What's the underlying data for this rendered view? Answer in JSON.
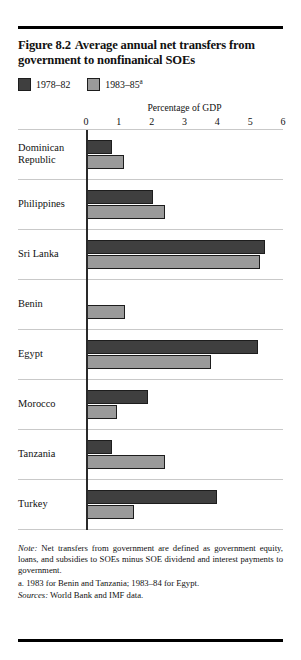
{
  "figure": {
    "number": "Figure 8.2",
    "title": "Average annual net transfers from government to nonfinanical SOEs"
  },
  "legend": {
    "items": [
      {
        "label": "1978–82",
        "superscript": "",
        "color": "#3f3f3f"
      },
      {
        "label": "1983–85",
        "superscript": "a",
        "color": "#9a9a9a"
      }
    ]
  },
  "notes": {
    "note_lead": "Note:",
    "note_text": " Net transfers from government are defined as government equity, loans, and subsidies to SOEs minus SOE dividend and interest payments to government.",
    "note_a": "a. 1983 for Benin and Tanzania; 1983–84 for Egypt.",
    "sources_lead": "Sources:",
    "sources_text": " World Bank and IMF data."
  },
  "chart_data": {
    "type": "bar",
    "orientation": "horizontal",
    "xlabel": "Percentage of GDP",
    "ylabel": "",
    "xlim": [
      0,
      6
    ],
    "xticks": [
      0,
      1,
      2,
      3,
      4,
      5,
      6
    ],
    "xticklabels": [
      "0",
      "1",
      "2",
      "3",
      "4",
      "5",
      "6"
    ],
    "grid": false,
    "legend_position": "top-left",
    "categories": [
      "Dominican Republic",
      "Philippines",
      "Sri Lanka",
      "Benin",
      "Egypt",
      "Morocco",
      "Tanzania",
      "Turkey"
    ],
    "series": [
      {
        "name": "1978–82",
        "color": "#3f3f3f",
        "values": [
          0.8,
          2.05,
          5.45,
          0,
          5.25,
          1.9,
          0.8,
          4.0
        ]
      },
      {
        "name": "1983–85",
        "color": "#9a9a9a",
        "values": [
          1.15,
          2.4,
          5.3,
          1.2,
          3.8,
          0.95,
          2.4,
          1.45
        ]
      }
    ]
  }
}
